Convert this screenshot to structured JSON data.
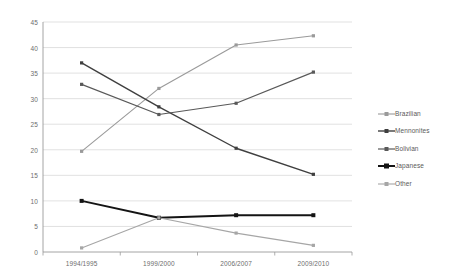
{
  "chart_data": {
    "type": "line",
    "title": "",
    "subtitle": "",
    "xlabel": "",
    "ylabel": "",
    "categories": [
      "1994/1995",
      "1999/2000",
      "2006/2007",
      "2009/2010"
    ],
    "ylim": [
      0,
      45
    ],
    "ytick_step": 5,
    "yticks": [
      "45",
      "40",
      "35",
      "30",
      "25",
      "20",
      "15",
      "10",
      "5",
      "0"
    ],
    "ytick_values": [
      45,
      40,
      35,
      30,
      25,
      20,
      15,
      10,
      5,
      0
    ],
    "grid": "horizontal",
    "legend_position": "right",
    "series": [
      {
        "name": "Brazilian",
        "values": [
          19.7,
          32.0,
          40.5,
          42.3
        ],
        "color": "#9a9a9a",
        "marker": "square",
        "line_width": 1.1
      },
      {
        "name": "Mennonites",
        "values": [
          37.0,
          28.4,
          20.3,
          15.2
        ],
        "color": "#3f3f3f",
        "marker": "square",
        "line_width": 1.4
      },
      {
        "name": "Bolivian",
        "values": [
          32.8,
          26.9,
          29.1,
          35.2
        ],
        "color": "#595959",
        "marker": "square",
        "line_width": 1.2
      },
      {
        "name": "Japanese",
        "values": [
          10.0,
          6.7,
          7.2,
          7.2
        ],
        "color": "#141414",
        "marker": "square",
        "line_width": 2.0
      },
      {
        "name": "Other",
        "values": [
          0.8,
          6.7,
          3.7,
          1.3
        ],
        "color": "#a6a6a6",
        "marker": "square",
        "line_width": 1.1
      }
    ]
  },
  "axis": {
    "line_color": "#9a9a9a",
    "grid_color": "#d9d9d9"
  }
}
